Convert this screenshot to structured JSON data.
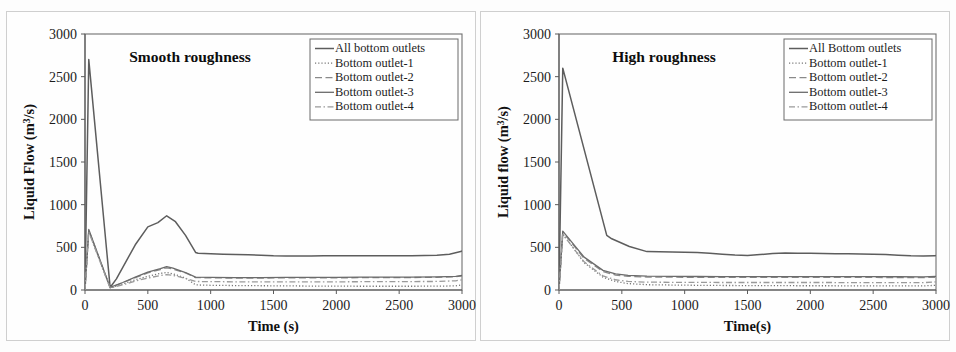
{
  "figure": {
    "background_color": "#fdfdfd",
    "panel_count": 2
  },
  "chart_data": [
    {
      "id": "smooth-roughness",
      "type": "line",
      "title": "Smooth roughness",
      "xlabel": "Time (s)",
      "ylabel_parts": {
        "pre": "Liquid Flow (m",
        "sup": "3",
        "post": "/s)"
      },
      "ylabel": "Liquid Flow (m3/s)",
      "xlim": [
        0,
        3000
      ],
      "ylim": [
        0,
        3000
      ],
      "xticks": [
        0,
        500,
        1000,
        1500,
        2000,
        2500,
        3000
      ],
      "yticks": [
        0,
        500,
        1000,
        1500,
        2000,
        2500,
        3000
      ],
      "grid": false,
      "legend_position": "top-right",
      "series": [
        {
          "name": "All bottom outlets",
          "style": "solid",
          "color": "#5d5d5d",
          "width": 1.5,
          "x": [
            0,
            30,
            200,
            250,
            400,
            500,
            580,
            650,
            720,
            800,
            880,
            900,
            1000,
            1100,
            1200,
            1300,
            1400,
            1500,
            1600,
            1700,
            1800,
            1900,
            2000,
            2100,
            2200,
            2300,
            2400,
            2500,
            2600,
            2700,
            2800,
            2900,
            2990,
            3000
          ],
          "y": [
            0,
            2700,
            30,
            130,
            530,
            740,
            790,
            870,
            800,
            640,
            440,
            430,
            425,
            420,
            415,
            412,
            408,
            400,
            398,
            398,
            398,
            400,
            402,
            402,
            400,
            400,
            400,
            400,
            402,
            405,
            408,
            420,
            450,
            460
          ]
        },
        {
          "name": "Bottom outlet-1",
          "style": "dotted",
          "color": "#777777",
          "width": 1.3,
          "x": [
            0,
            30,
            200,
            300,
            400,
            500,
            600,
            650,
            700,
            800,
            880,
            1000,
            1200,
            1400,
            1600,
            1800,
            2000,
            2200,
            2400,
            2600,
            2800,
            2950,
            3000
          ],
          "y": [
            0,
            690,
            25,
            70,
            120,
            160,
            195,
            205,
            190,
            140,
            60,
            55,
            52,
            50,
            48,
            46,
            45,
            44,
            44,
            44,
            45,
            48,
            60
          ]
        },
        {
          "name": "Bottom outlet-2",
          "style": "dashed",
          "color": "#8a8a8a",
          "width": 1.3,
          "x": [
            0,
            30,
            200,
            300,
            400,
            500,
            600,
            650,
            700,
            800,
            880,
            1000,
            1200,
            1400,
            1600,
            1800,
            2000,
            2200,
            2400,
            2600,
            2800,
            2950,
            3000
          ],
          "y": [
            0,
            700,
            28,
            85,
            145,
            200,
            240,
            260,
            245,
            200,
            145,
            142,
            140,
            140,
            142,
            142,
            143,
            144,
            145,
            146,
            148,
            155,
            165
          ]
        },
        {
          "name": "Bottom outlet-3",
          "style": "solid",
          "color": "#6b6b6b",
          "width": 1.3,
          "x": [
            0,
            30,
            200,
            300,
            400,
            500,
            600,
            650,
            700,
            800,
            880,
            1000,
            1200,
            1400,
            1600,
            1800,
            2000,
            2200,
            2400,
            2600,
            2800,
            2950,
            3000
          ],
          "y": [
            0,
            710,
            30,
            88,
            150,
            210,
            250,
            275,
            255,
            205,
            150,
            148,
            146,
            146,
            147,
            148,
            149,
            150,
            151,
            152,
            154,
            160,
            170
          ]
        },
        {
          "name": "Bottom outlet-4",
          "style": "dashdot",
          "color": "#9a9a9a",
          "width": 1.3,
          "x": [
            0,
            30,
            200,
            300,
            400,
            500,
            600,
            650,
            700,
            800,
            880,
            1000,
            1200,
            1400,
            1600,
            1800,
            2000,
            2200,
            2400,
            2600,
            2800,
            2950,
            3000
          ],
          "y": [
            0,
            680,
            22,
            60,
            105,
            140,
            170,
            180,
            172,
            135,
            100,
            98,
            96,
            95,
            95,
            96,
            96,
            97,
            98,
            99,
            100,
            108,
            120
          ]
        }
      ]
    },
    {
      "id": "high-roughness",
      "type": "line",
      "title": "High roughness",
      "xlabel": "Time(s)",
      "ylabel_parts": {
        "pre": "Liquid flow (m",
        "sup": "3",
        "post": "/s)"
      },
      "ylabel": "Liquid flow (m3/s)",
      "xlim": [
        0,
        3000
      ],
      "ylim": [
        0,
        3000
      ],
      "xticks": [
        0,
        500,
        1000,
        1500,
        2000,
        2500,
        3000
      ],
      "yticks": [
        0,
        500,
        1000,
        1500,
        2000,
        2500,
        3000
      ],
      "grid": false,
      "legend_position": "top-right",
      "series": [
        {
          "name": "All Bottom outlets",
          "style": "solid",
          "color": "#5d5d5d",
          "width": 1.5,
          "x": [
            0,
            30,
            380,
            420,
            560,
            700,
            800,
            900,
            1000,
            1100,
            1200,
            1300,
            1400,
            1500,
            1600,
            1700,
            1800,
            1900,
            2000,
            2100,
            2200,
            2300,
            2400,
            2500,
            2600,
            2700,
            2800,
            2900,
            2990,
            3000
          ],
          "y": [
            0,
            2600,
            640,
            600,
            510,
            450,
            448,
            445,
            442,
            438,
            430,
            420,
            410,
            405,
            415,
            428,
            435,
            432,
            430,
            428,
            426,
            424,
            422,
            420,
            415,
            408,
            400,
            398,
            400,
            405
          ]
        },
        {
          "name": "Bottom outlet-1",
          "style": "dotted",
          "color": "#777777",
          "width": 1.3,
          "x": [
            0,
            30,
            200,
            350,
            450,
            550,
            700,
            900,
            1100,
            1300,
            1500,
            1700,
            1900,
            2100,
            2300,
            2500,
            2700,
            2900,
            3000
          ],
          "y": [
            0,
            660,
            320,
            150,
            100,
            75,
            62,
            58,
            55,
            53,
            52,
            51,
            50,
            50,
            49,
            49,
            48,
            48,
            55
          ]
        },
        {
          "name": "Bottom outlet-2",
          "style": "dashed",
          "color": "#8a8a8a",
          "width": 1.3,
          "x": [
            0,
            30,
            200,
            350,
            450,
            550,
            700,
            900,
            1100,
            1300,
            1500,
            1700,
            1900,
            2100,
            2300,
            2500,
            2700,
            2900,
            3000
          ],
          "y": [
            0,
            680,
            370,
            215,
            175,
            160,
            152,
            150,
            149,
            148,
            148,
            148,
            148,
            148,
            147,
            147,
            146,
            145,
            150
          ]
        },
        {
          "name": "Bottom outlet-3",
          "style": "solid",
          "color": "#6b6b6b",
          "width": 1.3,
          "x": [
            0,
            30,
            200,
            350,
            450,
            550,
            700,
            900,
            1100,
            1300,
            1500,
            1700,
            1900,
            2100,
            2300,
            2500,
            2700,
            2900,
            3000
          ],
          "y": [
            0,
            690,
            385,
            230,
            188,
            172,
            163,
            160,
            158,
            157,
            157,
            157,
            157,
            157,
            156,
            156,
            155,
            154,
            160
          ]
        },
        {
          "name": "Bottom outlet-4",
          "style": "dashdot",
          "color": "#9a9a9a",
          "width": 1.3,
          "x": [
            0,
            30,
            200,
            350,
            450,
            550,
            700,
            900,
            1100,
            1300,
            1500,
            1700,
            1900,
            2100,
            2300,
            2500,
            2700,
            2900,
            3000
          ],
          "y": [
            0,
            650,
            330,
            165,
            120,
            100,
            92,
            90,
            89,
            88,
            88,
            88,
            88,
            88,
            87,
            87,
            86,
            86,
            95
          ]
        }
      ]
    }
  ]
}
